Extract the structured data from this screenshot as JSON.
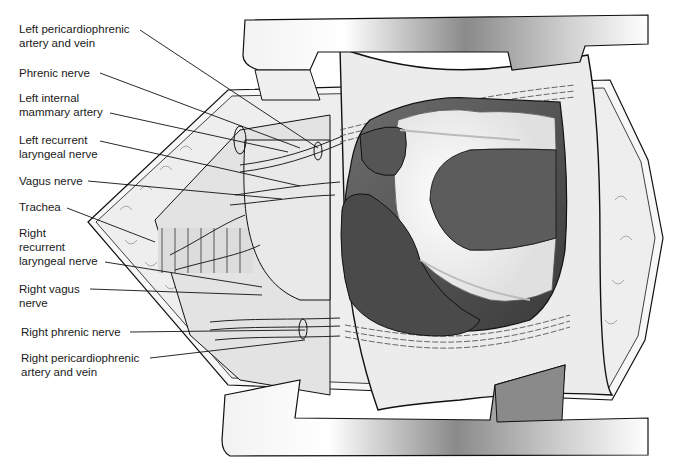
{
  "figure": {
    "colors": {
      "background": "#ffffff",
      "retractor_light": "#f4f4f4",
      "retractor_dark": "#7a7a7a",
      "tissue": "#e6e6e6",
      "fat": "#f2f2f2",
      "heart_dark": "#4a4a4a",
      "heart_mid": "#6a6a6a",
      "outline": "#111111"
    }
  },
  "labels": [
    {
      "id": "left-pericardiophrenic",
      "text": "Left pericardiophrenic\nartery and vein"
    },
    {
      "id": "phrenic-nerve",
      "text": "Phrenic nerve"
    },
    {
      "id": "left-internal-mammary",
      "text": "Left internal\nmammary artery"
    },
    {
      "id": "left-recurrent-laryngeal",
      "text": "Left recurrent\nlaryngeal nerve"
    },
    {
      "id": "vagus-nerve",
      "text": "Vagus nerve"
    },
    {
      "id": "trachea",
      "text": "Trachea"
    },
    {
      "id": "right-recurrent-laryngeal",
      "text": "Right\nrecurrent\nlaryngeal nerve"
    },
    {
      "id": "right-vagus",
      "text": "Right vagus\nnerve"
    },
    {
      "id": "right-phrenic",
      "text": "Right phrenic nerve"
    },
    {
      "id": "right-pericardiophrenic",
      "text": "Right pericardiophrenic\nartery and vein"
    }
  ]
}
